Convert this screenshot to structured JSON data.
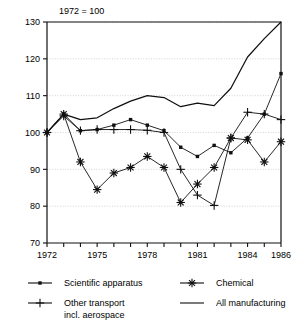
{
  "chart_data": {
    "type": "line",
    "title": "1972 = 100",
    "xlabel": "",
    "ylabel": "",
    "xlim": [
      1972,
      1986
    ],
    "ylim": [
      70,
      130
    ],
    "yticks": [
      70,
      80,
      90,
      100,
      110,
      120,
      130
    ],
    "xticks": [
      1972,
      1973,
      1974,
      1975,
      1976,
      1977,
      1978,
      1979,
      1980,
      1981,
      1982,
      1983,
      1984,
      1985,
      1986
    ],
    "xtick_labels": [
      "1972",
      "",
      "",
      "1975",
      "",
      "",
      "1978",
      "",
      "",
      "1981",
      "",
      "",
      "1984",
      "",
      "1986"
    ],
    "grid": "horizontal-dotted",
    "legend_position": "below",
    "x": [
      1972,
      1973,
      1974,
      1975,
      1976,
      1977,
      1978,
      1979,
      1980,
      1981,
      1982,
      1983,
      1984,
      1985,
      1986
    ],
    "series": [
      {
        "name": "Scientific apparatus",
        "marker": "square",
        "values": [
          100.0,
          105.0,
          100.5,
          100.8,
          102.0,
          103.5,
          102.0,
          100.5,
          96.0,
          93.5,
          96.5,
          94.5,
          98.5,
          105.0,
          116.0
        ]
      },
      {
        "name": "Chemical",
        "marker": "asterisk",
        "values": [
          100.0,
          105.0,
          92.0,
          84.5,
          89.0,
          90.5,
          93.5,
          90.5,
          81.0,
          86.0,
          90.5,
          98.5,
          98.0,
          92.0,
          97.5
        ]
      },
      {
        "name": "Other transport incl. aerospace",
        "marker": "plus",
        "values": [
          100.0,
          104.5,
          100.5,
          100.8,
          100.8,
          100.8,
          100.6,
          100.0,
          90.0,
          83.0,
          80.2,
          98.5,
          105.5,
          105.0,
          103.5
        ]
      },
      {
        "name": "All manufacturing",
        "marker": "none",
        "values": [
          100.0,
          105.0,
          103.5,
          104.0,
          106.5,
          108.5,
          110.0,
          109.5,
          107.0,
          108.0,
          107.3,
          112.0,
          120.5,
          125.5,
          130.0
        ]
      }
    ]
  },
  "axis": {
    "title": "1972 = 100",
    "y_labels": [
      "130",
      "120",
      "110",
      "100",
      "90",
      "80",
      "70"
    ],
    "x_labels": [
      "1972",
      "1975",
      "1978",
      "1981",
      "1984",
      "1986"
    ]
  },
  "legend": {
    "items": [
      {
        "label": "Scientific apparatus",
        "marker": "square"
      },
      {
        "label": "Chemical",
        "marker": "asterisk"
      },
      {
        "label": "Other transport",
        "label2": "incl. aerospace",
        "marker": "plus"
      },
      {
        "label": "All manufacturing",
        "marker": "none"
      }
    ]
  },
  "colors": {
    "ink": "#101010",
    "grid": "#c8c8c8",
    "background": "#ffffff"
  }
}
